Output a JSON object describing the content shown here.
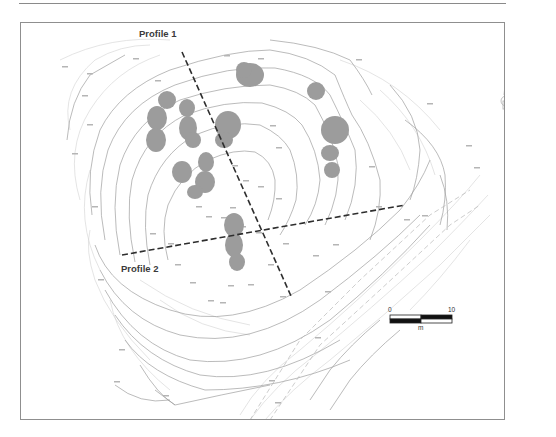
{
  "figure": {
    "type": "topographic site plan",
    "profiles": [
      {
        "id": "profile-1",
        "label": "Profile 1"
      },
      {
        "id": "profile-2",
        "label": "Profile 2"
      }
    ],
    "scale_bar": {
      "start_label": "0",
      "end_label": "10",
      "unit_label": "m"
    },
    "north_arrow": {
      "icon": "north-arrow-icon"
    },
    "colors": {
      "frame": "#8f8f8f",
      "contour": "#9a9a9a",
      "contour_faint": "#cfcfcf",
      "tree_fill": "#9b9b9b",
      "profile_line": "#333333"
    }
  }
}
